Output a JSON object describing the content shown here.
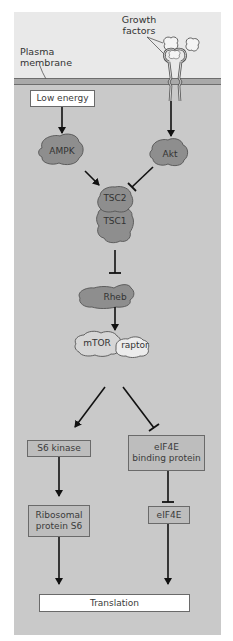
{
  "diagram": {
    "type": "signaling-pathway",
    "colors": {
      "outside_bg": "#e9e9e9",
      "cytoplasm_bg": "#c9c9c9",
      "membrane": "#7a7a7a",
      "protein_dark": "#8f8f8f",
      "protein_light": "#dcdcdc",
      "box_fill": "#bdbdbd",
      "box_white": "#ffffff",
      "arrow": "#111111"
    },
    "labels": {
      "growth_factors": [
        "Growth",
        "factors"
      ],
      "plasma_membrane": [
        "Plasma",
        "membrane"
      ]
    },
    "nodes": {
      "low_energy": "Low energy",
      "ampk": "AMPK",
      "akt": "Akt",
      "tsc2": "TSC2",
      "tsc1": "TSC1",
      "rheb": "Rheb",
      "mtor": "mTOR",
      "raptor": "raptor",
      "s6_kinase": "S6 kinase",
      "eif4e_bp": [
        "eIF4E",
        "binding protein"
      ],
      "ribosomal_s6": [
        "Ribosomal",
        "protein S6"
      ],
      "eif4e": "eIF4E",
      "translation": "Translation"
    },
    "edges": [
      {
        "from": "Low energy",
        "to": "AMPK",
        "type": "activation"
      },
      {
        "from": "Growth factors receptor",
        "to": "Akt",
        "type": "activation"
      },
      {
        "from": "AMPK",
        "to": "TSC1/TSC2",
        "type": "activation"
      },
      {
        "from": "Akt",
        "to": "TSC1/TSC2",
        "type": "inhibition"
      },
      {
        "from": "TSC1/TSC2",
        "to": "Rheb",
        "type": "inhibition"
      },
      {
        "from": "Rheb",
        "to": "mTOR/raptor",
        "type": "activation"
      },
      {
        "from": "mTOR/raptor",
        "to": "S6 kinase",
        "type": "activation"
      },
      {
        "from": "mTOR/raptor",
        "to": "eIF4E binding protein",
        "type": "inhibition"
      },
      {
        "from": "S6 kinase",
        "to": "Ribosomal protein S6",
        "type": "activation"
      },
      {
        "from": "eIF4E binding protein",
        "to": "eIF4E",
        "type": "inhibition"
      },
      {
        "from": "Ribosomal protein S6",
        "to": "Translation",
        "type": "activation"
      },
      {
        "from": "eIF4E",
        "to": "Translation",
        "type": "activation"
      }
    ]
  }
}
